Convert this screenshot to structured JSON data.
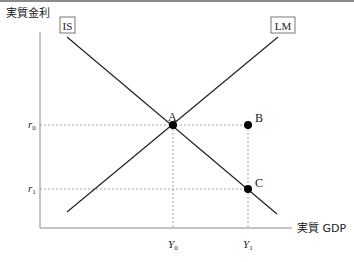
{
  "diagram": {
    "type": "IS-LM",
    "y_axis_label": "実質金利",
    "x_axis_label": "実質 GDP",
    "curves": [
      {
        "label": "IS",
        "from": [
          67,
          37
        ],
        "to": [
          277,
          214
        ]
      },
      {
        "label": "LM",
        "from": [
          67,
          212
        ],
        "to": [
          278,
          37
        ]
      }
    ],
    "points": [
      {
        "label": "A",
        "x": 173,
        "y": 125
      },
      {
        "label": "B",
        "x": 248,
        "y": 125
      },
      {
        "label": "C",
        "x": 248,
        "y": 189
      }
    ],
    "y_ticks": [
      {
        "label": "r",
        "sub": "0",
        "y": 125
      },
      {
        "label": "r",
        "sub": "1",
        "y": 189
      }
    ],
    "x_ticks": [
      {
        "label": "Y",
        "sub": "0",
        "x": 173
      },
      {
        "label": "Y",
        "sub": "1",
        "x": 248
      }
    ],
    "colors": {
      "line": "#222222",
      "axis": "#888888",
      "guide": "#999999",
      "point": "#000000"
    }
  }
}
